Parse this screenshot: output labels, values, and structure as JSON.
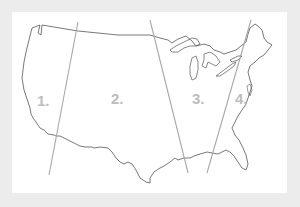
{
  "map": {
    "subject": "United States outline divided into zones",
    "colors": {
      "background": "#ececec",
      "card": "#ffffff",
      "outline": "#555555",
      "divider": "#a8a8a8",
      "label": "#bdbdbd"
    },
    "regions": [
      {
        "id": 1,
        "label": "1."
      },
      {
        "id": 2,
        "label": "2."
      },
      {
        "id": 3,
        "label": "3."
      },
      {
        "id": 4,
        "label": "4."
      }
    ],
    "dividers": [
      {
        "from": [
          78,
          22
        ],
        "to": [
          49,
          175
        ]
      },
      {
        "from": [
          150,
          20
        ],
        "to": [
          188,
          173
        ]
      },
      {
        "from": [
          251,
          20
        ],
        "to": [
          207,
          173
        ]
      }
    ]
  }
}
